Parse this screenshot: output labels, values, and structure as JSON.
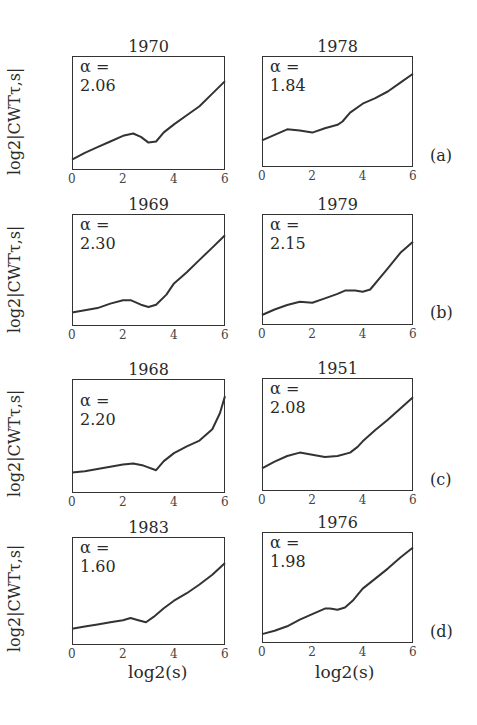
{
  "figure": {
    "ylabel": "log2|CWTτ,s|",
    "xlabel": "log2(s)",
    "xticks": [
      "0",
      "2",
      "4",
      "6"
    ],
    "yticks": [
      "0",
      "5",
      "10"
    ],
    "row_labels": [
      "(a)",
      "(b)",
      "(c)",
      "(d)"
    ]
  },
  "panels": [
    {
      "year": "1970",
      "alpha": "α = 2.06",
      "code": "CMO"
    },
    {
      "year": "1978",
      "alpha": "α = 1.84",
      "code": "ABK"
    },
    {
      "year": "1969",
      "alpha": "α = 2.30",
      "code": "ESK"
    },
    {
      "year": "1979",
      "alpha": "α = 2.15",
      "code": "NGK"
    },
    {
      "year": "1968",
      "alpha": "α = 2.20",
      "code": "GUA"
    },
    {
      "year": "1951",
      "alpha": "α = 2.08",
      "code": "ABG"
    },
    {
      "year": "1983",
      "alpha": "α = 1.60",
      "code": "HER"
    },
    {
      "year": "1976",
      "alpha": "α = 1.98",
      "code": "API"
    }
  ],
  "chart_data": [
    {
      "type": "line",
      "title": "1970",
      "annotation": "α = 2.06",
      "station": "CMO",
      "row": "(a)",
      "xlabel": "log2(s)",
      "ylabel": "log2|CWTτ,s|",
      "xlim": [
        0,
        6
      ],
      "ylim": [
        0,
        10
      ],
      "x": [
        0,
        0.5,
        1,
        1.5,
        2,
        2.4,
        2.7,
        3,
        3.3,
        3.6,
        4,
        4.5,
        5,
        5.5,
        6
      ],
      "y": [
        0.9,
        1.5,
        2.0,
        2.5,
        3.0,
        3.2,
        2.9,
        2.4,
        2.5,
        3.3,
        4.0,
        4.8,
        5.6,
        6.7,
        7.8
      ]
    },
    {
      "type": "line",
      "title": "1978",
      "annotation": "α = 1.84",
      "station": "ABK",
      "row": "(a)",
      "xlabel": "log2(s)",
      "ylabel": "log2|CWTτ,s|",
      "xlim": [
        0,
        6
      ],
      "ylim": [
        0,
        10
      ],
      "x": [
        0,
        0.5,
        1,
        1.5,
        2,
        2.5,
        3,
        3.2,
        3.5,
        4,
        4.5,
        5,
        5.5,
        6
      ],
      "y": [
        2.4,
        2.9,
        3.4,
        3.3,
        3.1,
        3.5,
        3.8,
        4.1,
        4.9,
        5.7,
        6.2,
        6.8,
        7.6,
        8.4
      ]
    },
    {
      "type": "line",
      "title": "1969",
      "annotation": "α = 2.30",
      "station": "ESK",
      "row": "(b)",
      "xlabel": "log2(s)",
      "ylabel": "log2|CWTτ,s|",
      "xlim": [
        0,
        6
      ],
      "ylim": [
        0,
        10
      ],
      "x": [
        0,
        0.5,
        1,
        1.5,
        2,
        2.3,
        2.7,
        3,
        3.3,
        3.7,
        4,
        4.5,
        5,
        5.5,
        6
      ],
      "y": [
        1.2,
        1.4,
        1.6,
        2.0,
        2.3,
        2.3,
        1.9,
        1.7,
        1.9,
        2.8,
        3.8,
        4.8,
        5.9,
        7.0,
        8.1
      ]
    },
    {
      "type": "line",
      "title": "1979",
      "annotation": "α = 2.15",
      "station": "NGK",
      "row": "(b)",
      "xlabel": "log2(s)",
      "ylabel": "log2|CWTτ,s|",
      "xlim": [
        0,
        6
      ],
      "ylim": [
        0,
        10
      ],
      "x": [
        0,
        0.5,
        1,
        1.5,
        2,
        2.5,
        3,
        3.3,
        3.7,
        4,
        4.3,
        4.7,
        5,
        5.5,
        6
      ],
      "y": [
        0.9,
        1.4,
        1.8,
        2.1,
        2.0,
        2.4,
        2.8,
        3.1,
        3.1,
        3.0,
        3.2,
        4.3,
        5.1,
        6.5,
        7.5
      ]
    },
    {
      "type": "line",
      "title": "1968",
      "annotation": "α = 2.20",
      "station": "GUA",
      "row": "(c)",
      "xlabel": "log2(s)",
      "ylabel": "log2|CWTτ,s|",
      "xlim": [
        0,
        6
      ],
      "ylim": [
        0,
        10
      ],
      "x": [
        0,
        0.5,
        1,
        1.5,
        2,
        2.4,
        2.8,
        3.3,
        3.6,
        4,
        4.5,
        5,
        5.5,
        5.8,
        6
      ],
      "y": [
        1.8,
        1.9,
        2.1,
        2.3,
        2.5,
        2.6,
        2.4,
        2.0,
        2.8,
        3.5,
        4.1,
        4.6,
        5.6,
        7.0,
        8.5
      ]
    },
    {
      "type": "line",
      "title": "1951",
      "annotation": "α = 2.08",
      "station": "ABG",
      "row": "(c)",
      "xlabel": "log2(s)",
      "ylabel": "log2|CWTτ,s|",
      "xlim": [
        0,
        6
      ],
      "ylim": [
        0,
        10
      ],
      "x": [
        0,
        0.5,
        1,
        1.5,
        2,
        2.5,
        3,
        3.5,
        3.8,
        4,
        4.5,
        5,
        5.5,
        6
      ],
      "y": [
        2.0,
        2.6,
        3.1,
        3.4,
        3.2,
        3.0,
        3.1,
        3.4,
        3.9,
        4.4,
        5.4,
        6.3,
        7.3,
        8.3
      ]
    },
    {
      "type": "line",
      "title": "1983",
      "annotation": "α = 1.60",
      "station": "HER",
      "row": "(d)",
      "xlabel": "log2(s)",
      "ylabel": "log2|CWTτ,s|",
      "xlim": [
        0,
        6
      ],
      "ylim": [
        0,
        10
      ],
      "x": [
        0,
        0.5,
        1,
        1.5,
        2,
        2.3,
        2.6,
        2.9,
        3.2,
        3.6,
        4,
        4.5,
        5,
        5.5,
        6
      ],
      "y": [
        1.5,
        1.7,
        1.9,
        2.1,
        2.3,
        2.5,
        2.3,
        2.1,
        2.6,
        3.4,
        4.1,
        4.8,
        5.6,
        6.5,
        7.6
      ]
    },
    {
      "type": "line",
      "title": "1976",
      "annotation": "α = 1.98",
      "station": "API",
      "row": "(d)",
      "xlabel": "log2(s)",
      "ylabel": "log2|CWTτ,s|",
      "xlim": [
        0,
        6
      ],
      "ylim": [
        0,
        10
      ],
      "x": [
        0,
        0.5,
        1,
        1.5,
        2,
        2.5,
        2.7,
        3,
        3.3,
        3.6,
        4,
        4.5,
        5,
        5.5,
        6
      ],
      "y": [
        0.8,
        1.1,
        1.5,
        2.1,
        2.6,
        3.1,
        3.1,
        3.0,
        3.2,
        3.8,
        4.9,
        5.8,
        6.7,
        7.7,
        8.6
      ]
    }
  ]
}
